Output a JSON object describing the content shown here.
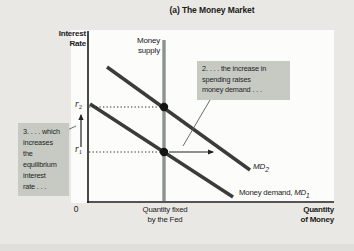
{
  "figure": {
    "title": "(a) The Money Market",
    "y_axis_label": {
      "line1": "Interest",
      "line2": "Rate"
    },
    "x_axis_label": {
      "line1": "Quantity",
      "line2": "of Money"
    },
    "origin_label": "0",
    "x_tick_label": {
      "line1": "Quantity fixed",
      "line2": "by the Fed"
    },
    "y_ticks": {
      "r2": {
        "base": "r",
        "sub": "2"
      },
      "r1": {
        "base": "r",
        "sub": "1"
      }
    },
    "curve_labels": {
      "supply": {
        "line1": "Money",
        "line2": "supply"
      },
      "md2": {
        "base": "MD",
        "sub": "2"
      },
      "md1": {
        "prefix": "Money demand, ",
        "base": "MD",
        "sub": "1"
      }
    },
    "callouts": {
      "box2": {
        "lines": [
          "2. . . . the increase in",
          "spending raises",
          "money demand . . ."
        ]
      },
      "box3": {
        "lines": [
          "3. . . . which",
          "increases",
          "the",
          "equilibrium",
          "interest",
          "rate . . ."
        ]
      }
    }
  },
  "colors": {
    "page_bg": "#e9e8e4",
    "plot_bg": "#fcfcfa",
    "callout_bg": "#c7cac3",
    "ink": "#1b1b1b",
    "supply_line": "#8b948c",
    "demand_line": "#3b3b39",
    "dot": "#141414"
  },
  "chart_data": {
    "type": "line",
    "title": "(a) The Money Market",
    "xlabel": "Quantity of Money",
    "ylabel": "Interest Rate",
    "x_tick_labels": [
      "0",
      "Quantity fixed by the Fed"
    ],
    "y_tick_labels": [
      "r1",
      "r2"
    ],
    "legend_position": "none",
    "grid": false,
    "series_summary": [
      {
        "name": "Money supply",
        "shape": "vertical line at fixed quantity"
      },
      {
        "name": "Money demand MD1",
        "shape": "downward-sloping, equilibrium at r1"
      },
      {
        "name": "Money demand MD2",
        "shape": "downward-sloping, shifted right, equilibrium at r2"
      }
    ],
    "dot_color": "#141414",
    "lines": [
      {
        "name": "y-axis",
        "x1": 88,
        "y1": 31,
        "x2": 88,
        "y2": 203,
        "color": "#1c1c1c",
        "w": 1.6
      },
      {
        "name": "x-axis",
        "x1": 87,
        "y1": 202,
        "x2": 334,
        "y2": 202,
        "color": "#1c1c1c",
        "w": 1.6
      },
      {
        "name": "money-supply-curve",
        "x1": 164,
        "y1": 40,
        "x2": 164,
        "y2": 201,
        "color": "#8b948c",
        "w": 3.4
      },
      {
        "name": "md2-curve",
        "x1": 107,
        "y1": 67,
        "x2": 250,
        "y2": 170,
        "color": "#3b3b39",
        "w": 3.4
      },
      {
        "name": "md1-curve",
        "x1": 90,
        "y1": 104,
        "x2": 233,
        "y2": 197,
        "color": "#3b3b39",
        "w": 3.4
      },
      {
        "name": "r2-dotted-guide",
        "x1": 89,
        "y1": 107,
        "x2": 160,
        "y2": 107,
        "color": "#2a2a2a",
        "w": 1,
        "dash": "1.3,2.2"
      },
      {
        "name": "r1-dotted-guide",
        "x1": 89,
        "y1": 152,
        "x2": 160,
        "y2": 152,
        "color": "#2a2a2a",
        "w": 1,
        "dash": "1.3,2.2"
      },
      {
        "name": "demand-shift-arrow",
        "x1": 169,
        "y1": 152,
        "x2": 213,
        "y2": 152,
        "color": "#222222",
        "w": 1.2,
        "arrow": true
      },
      {
        "name": "rate-rise-arrow",
        "x1": 81,
        "y1": 147,
        "x2": 81,
        "y2": 115,
        "color": "#222222",
        "w": 1.2,
        "arrow": true
      },
      {
        "name": "callout2-pointer",
        "x1": 210,
        "y1": 100,
        "x2": 183,
        "y2": 146,
        "color": "#5a5a58",
        "w": 0.9
      },
      {
        "name": "callout3-pointer",
        "x1": 63,
        "y1": 132,
        "x2": 76,
        "y2": 126,
        "color": "#5a5a58",
        "w": 0.9
      }
    ],
    "dots": [
      {
        "name": "equilibrium-point-r2",
        "x": 164,
        "y": 107,
        "r": 4.2
      },
      {
        "name": "equilibrium-point-r1",
        "x": 164,
        "y": 152,
        "r": 4.2
      }
    ]
  }
}
